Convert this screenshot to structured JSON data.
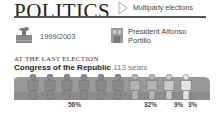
{
  "header": {
    "title": "POLITICS",
    "subtitle": "Multiparty elections"
  },
  "info": {
    "term": "1999/2003",
    "president_line1": "President Alfonso",
    "president_line2": "Portillo"
  },
  "section": {
    "kicker": "AT THE LAST ELECTION",
    "body_name": "Congress of the Republic",
    "seats": "113 seats"
  },
  "colors": {
    "party1": "#8a8a8a",
    "party2": "#b4b4b4",
    "party3": "#c8c8c8",
    "party4": "#e2e2e2",
    "bench": "#999999"
  },
  "chart_data": {
    "type": "pictogram",
    "title": "Congress of the Republic 113 seats",
    "categories": [
      "Party 1",
      "Party 2",
      "Party 3",
      "Party 4"
    ],
    "values": [
      56,
      32,
      9,
      3
    ],
    "unit": "%",
    "labels": [
      "56%",
      "32%",
      "9%",
      "3%"
    ],
    "figures_per_party": [
      6,
      2,
      1,
      1
    ]
  }
}
